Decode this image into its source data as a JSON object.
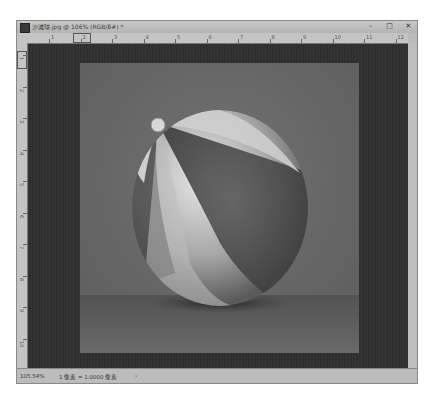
{
  "window": {
    "title": "沙滩球.jpg @ 106% (RGB/8#) *",
    "controls": {
      "minimize": "–",
      "maximize": "□",
      "close": "✕"
    }
  },
  "rulers": {
    "top_labels": [
      "1",
      "2",
      "3",
      "4",
      "5",
      "6",
      "7",
      "8",
      "9",
      "10",
      "11",
      "12"
    ],
    "left_labels": [
      "1",
      "2",
      "3",
      "4",
      "5",
      "6",
      "7",
      "8",
      "9",
      "10"
    ]
  },
  "canvas": {
    "image_subject": "beach ball",
    "pasteboard_color": "#2f2f2f",
    "image_background_color": "#676767"
  },
  "statusbar": {
    "zoom": "105.54%",
    "doc_info": "1 像素 = 1.0000 像素",
    "arrow": "›"
  }
}
